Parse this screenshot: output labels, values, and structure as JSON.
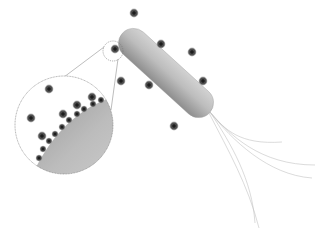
{
  "figure": {
    "ion_symbol": "+",
    "colors": {
      "background": "#ffffff",
      "cell_light": "#c4c4c4",
      "cell_dark": "#8a8a8a",
      "ion_fill": "#4a4a4a",
      "ion_glow": "#9a9a9a",
      "ion_sign": "#111111",
      "outline": "#777777",
      "flagella": "#bdbdbd"
    },
    "bacterium": {
      "x1": 133,
      "y1": 43,
      "x2": 199,
      "y2": 103,
      "thickness": 30
    },
    "free_ions": [
      {
        "x": 134,
        "y": 13
      },
      {
        "x": 115,
        "y": 49
      },
      {
        "x": 161,
        "y": 44
      },
      {
        "x": 192,
        "y": 52
      },
      {
        "x": 203,
        "y": 81
      },
      {
        "x": 149,
        "y": 85
      },
      {
        "x": 121,
        "y": 81
      },
      {
        "x": 174,
        "y": 126
      }
    ],
    "focus_circle": {
      "cx": 113,
      "cy": 51,
      "r": 10
    },
    "inset": {
      "cx": 64,
      "cy": 125,
      "r": 49,
      "free_ions": [
        {
          "x": 49,
          "y": 89
        },
        {
          "x": 31,
          "y": 118
        },
        {
          "x": 77,
          "y": 105
        },
        {
          "x": 92,
          "y": 97
        },
        {
          "x": 63,
          "y": 114
        },
        {
          "x": 42,
          "y": 136
        }
      ],
      "surface_ions": [
        {
          "x": 39,
          "y": 158
        },
        {
          "x": 43,
          "y": 149
        },
        {
          "x": 49,
          "y": 141
        },
        {
          "x": 55,
          "y": 134
        },
        {
          "x": 62,
          "y": 127
        },
        {
          "x": 69,
          "y": 120
        },
        {
          "x": 77,
          "y": 114
        },
        {
          "x": 84,
          "y": 109
        },
        {
          "x": 93,
          "y": 104
        },
        {
          "x": 101,
          "y": 100
        }
      ]
    }
  }
}
